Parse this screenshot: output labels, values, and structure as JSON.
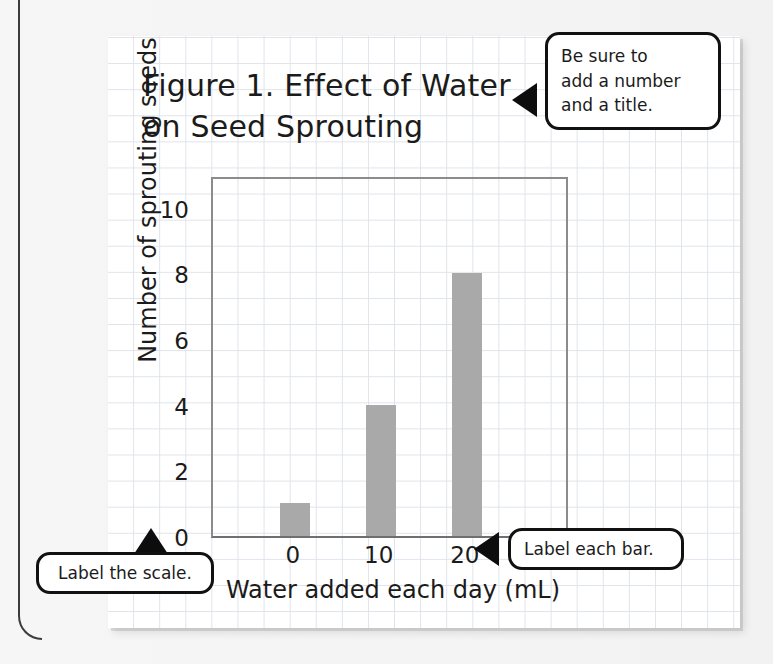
{
  "chart_data": {
    "type": "bar",
    "title": "Figure 1. Effect of Water\non Seed Sprouting",
    "xlabel": "Water added each day (mL)",
    "ylabel": "Number of sprouting seeds",
    "categories": [
      "0",
      "10",
      "20"
    ],
    "values": [
      1,
      4,
      8
    ],
    "yticks": [
      "0",
      "2",
      "4",
      "6",
      "8",
      "10"
    ],
    "ytick_values": [
      0,
      2,
      4,
      6,
      8,
      10
    ],
    "ylim": [
      0,
      11
    ],
    "grid": true,
    "legend": "none",
    "bar_color": "#a9a9a9",
    "axis_color": "#8c8c8c"
  },
  "callouts": {
    "title_note": "Be sure to\nadd a number\nand a title.",
    "bar_note": "Label each bar.",
    "scale_note": "Label the scale."
  },
  "colors": {
    "page_background": "#f2f2f2",
    "paper": "#ffffff",
    "grid_line": "#dfe3ea",
    "ink": "#1b1b1b",
    "callout_border": "#111111"
  }
}
